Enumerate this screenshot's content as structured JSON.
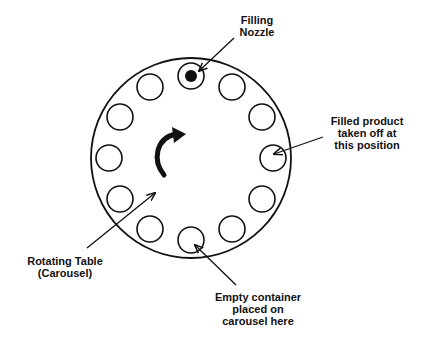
{
  "diagram": {
    "colors": {
      "stroke": "#111111",
      "background": "#ffffff"
    },
    "table": {
      "cx": 191,
      "cy": 158,
      "r": 100,
      "name": "Rotating Table (Carousel)"
    },
    "positions": {
      "count": 12,
      "ring_radius": 82,
      "container_radius": 13,
      "nozzle_position_index": 0,
      "nozzle_dot_radius": 6
    },
    "rotation_indicator": {
      "direction": "clockwise",
      "icon": "curved-arrow-clockwise-icon"
    },
    "labels": {
      "filling_nozzle": {
        "lines": [
          "Filling",
          "Nozzle"
        ],
        "x": 257,
        "y": 14
      },
      "filled_product": {
        "lines": [
          "Filled product",
          "taken off at",
          "this position"
        ],
        "x": 367,
        "y": 115
      },
      "rotating_table": {
        "lines": [
          "Rotating Table",
          "(Carousel)"
        ],
        "x": 65,
        "y": 255
      },
      "empty_container": {
        "lines": [
          "Empty container",
          "placed on",
          "carousel here"
        ],
        "x": 258,
        "y": 291
      }
    },
    "arrows": [
      {
        "name": "nozzle-pointer-arrow",
        "x1": 234,
        "y1": 38,
        "x2": 199,
        "y2": 71
      },
      {
        "name": "filled-product-pointer-arrow",
        "x1": 323,
        "y1": 137,
        "x2": 274,
        "y2": 154
      },
      {
        "name": "rotating-table-pointer-arrow",
        "x1": 87,
        "y1": 248,
        "x2": 155,
        "y2": 193
      },
      {
        "name": "empty-container-pointer-arrow",
        "x1": 236,
        "y1": 285,
        "x2": 195,
        "y2": 245
      }
    ]
  }
}
